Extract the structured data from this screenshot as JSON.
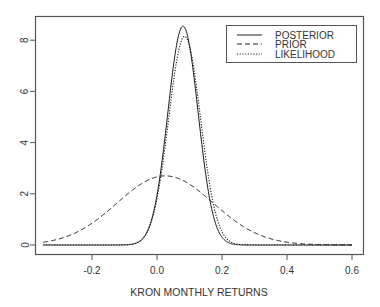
{
  "chart_data": {
    "type": "line",
    "title": "",
    "xlabel": "KRON MONTHLY RETURNS",
    "ylabel": "",
    "xlim": [
      -0.35,
      0.6
    ],
    "ylim": [
      0,
      9
    ],
    "x_ticks": [
      -0.2,
      0.0,
      0.2,
      0.4,
      0.6
    ],
    "x_tick_labels": [
      "-0.2",
      "0.0",
      "0.2",
      "0.4",
      "0.6"
    ],
    "y_ticks": [
      0,
      2,
      4,
      6,
      8
    ],
    "y_tick_labels": [
      "0",
      "2",
      "4",
      "6",
      "8"
    ],
    "grid": false,
    "legend_position": "top-right",
    "series": [
      {
        "name": "POSTERIOR",
        "linestyle": "solid",
        "distribution": "normal",
        "mean": 0.08,
        "sd": 0.0465,
        "peak": 8.55
      },
      {
        "name": "PRIOR",
        "linestyle": "dashed",
        "distribution": "normal",
        "mean": 0.025,
        "sd": 0.148,
        "peak": 2.7
      },
      {
        "name": "LIKELIHOOD",
        "linestyle": "dotted",
        "distribution": "normal",
        "mean": 0.085,
        "sd": 0.049,
        "peak": 8.15
      }
    ],
    "x": [
      -0.35,
      -0.3,
      -0.2,
      -0.1,
      0.0,
      0.05,
      0.08,
      0.1,
      0.15,
      0.2,
      0.3,
      0.4,
      0.5,
      0.6
    ],
    "values_sampled": {
      "POSTERIOR": [
        0.0,
        0.0,
        0.0,
        0.0,
        0.2,
        2.2,
        8.55,
        7.8,
        3.1,
        0.26,
        0.0,
        0.0,
        0.0,
        0.0
      ],
      "PRIOR": [
        0.17,
        0.31,
        0.83,
        1.66,
        2.66,
        2.62,
        2.55,
        2.46,
        2.02,
        1.51,
        0.65,
        0.21,
        0.05,
        0.01
      ],
      "LIKELIHOOD": [
        0.0,
        0.0,
        0.0,
        0.0,
        0.24,
        2.0,
        7.8,
        8.1,
        3.6,
        0.41,
        0.0,
        0.0,
        0.0,
        0.0
      ]
    }
  },
  "legend": {
    "items": [
      {
        "label": "POSTERIOR"
      },
      {
        "label": "PRIOR"
      },
      {
        "label": "LIKELIHOOD"
      }
    ]
  },
  "axes": {
    "xlabel": "KRON MONTHLY RETURNS"
  }
}
